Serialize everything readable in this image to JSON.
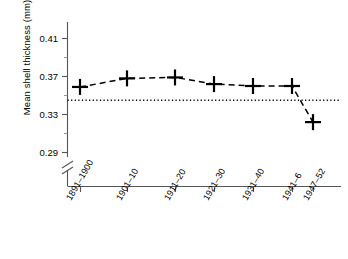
{
  "chart_data": {
    "type": "line",
    "title": "",
    "xlabel": "",
    "ylabel": "Mean shell thickness (mm)",
    "categories": [
      "1891–1900",
      "1901–10",
      "1911–20",
      "1921–30",
      "1931–40",
      "1941–6",
      "1947–52"
    ],
    "values": [
      0.359,
      0.368,
      0.369,
      0.362,
      0.36,
      0.36,
      0.322
    ],
    "series": [
      {
        "name": "Mean shell thickness",
        "values": [
          0.359,
          0.368,
          0.369,
          0.362,
          0.36,
          0.36,
          0.322
        ],
        "line_style": "dashed",
        "marker": "plus",
        "color": "#000000"
      }
    ],
    "reference_line": {
      "value": 0.345,
      "style": "dotted",
      "orientation": "horizontal",
      "color": "#000000"
    },
    "yticks": [
      0.29,
      0.33,
      0.37,
      0.41
    ],
    "ytick_labels": [
      "0.29",
      "0.33",
      "0.37",
      "0.41"
    ],
    "ylim": [
      0.29,
      0.425
    ],
    "axis_break": true,
    "grid": false,
    "legend": "none"
  },
  "axis": {
    "y_label": "Mean shell thickness (mm)",
    "y_tick_labels": [
      "0.41",
      "0.37",
      "0.33",
      "0.29"
    ],
    "x_tick_labels": [
      "1891–1900",
      "1901–10",
      "1911–20",
      "1921–30",
      "1931–40",
      "1941–6",
      "1947–52"
    ]
  },
  "colors": {
    "line": "#000000",
    "marker": "#000000",
    "reference": "#000000",
    "axis": "#555555",
    "background": "#ffffff"
  }
}
